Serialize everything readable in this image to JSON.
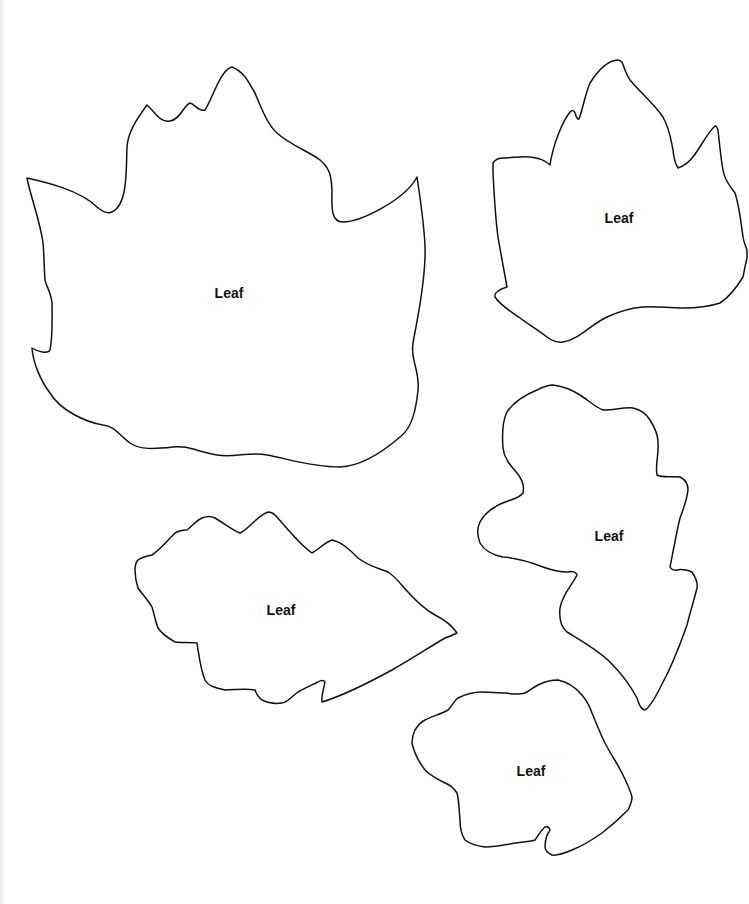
{
  "page": {
    "title": "",
    "background": "#ffffff",
    "stroke_color": "#111111"
  },
  "leaves": [
    {
      "id": "large-leaf",
      "label": "Leaf",
      "label_pos": [
        229,
        294
      ],
      "path": "M27,178 C45,182 80,190 97,207 C103,212 108,214 112,212 C128,205 126,170 127,147 C128,130 140,115 147,105 C155,112 160,123 170,121 C180,120 184,105 190,103 C195,104 198,112 205,110 C212,100 220,70 232,67 C245,72 250,85 255,93 C262,110 268,125 277,133 C290,145 310,152 320,160 C332,170 331,180 332,190 C332,205 330,222 343,222 C360,222 405,200 417,177 C422,210 426,240 425,257 C424,290 418,315 413,343 C410,360 420,370 418,390 C416,410 412,428 400,437 C385,450 362,466 340,467 C310,467 285,458 267,455 C250,451 235,458 217,455 C198,452 188,445 173,447 C155,449 140,450 130,443 C120,436 115,426 103,425 C85,422 60,410 50,393 C40,380 33,362 32,348 C38,352 48,354 50,350 C53,335 52,318 52,303 C51,292 46,286 45,280 C44,265 44,252 43,243 C40,220 30,195 27,178 Z"
    },
    {
      "id": "top-right-leaf",
      "label": "Leaf",
      "label_pos": [
        619,
        219
      ],
      "path": "M493,163 C495,160 499,158 503,158 C512,158 522,156 530,157 C540,158 546,161 550,165 C553,145 562,122 570,112 C572,110 574,110 575,113 C576,117 578,120 579,119 C583,108 585,95 590,83 C597,72 607,61 617,60 C620,60 621,61 622,62 C625,70 627,76 630,80 C640,92 655,105 663,117 C670,130 671,140 673,150 C674,160 676,165 678,168 C684,166 689,162 693,157 C700,148 708,132 715,126 C716,126 717,127 718,130 C720,148 721,160 723,170 C725,182 731,187 735,193 C739,205 741,222 743,237 C744,243 746,247 747,250 L747,258 C745,266 744,272 743,277 C735,290 728,298 720,303 C708,307 695,308 683,308 C668,308 655,306 643,307 C628,308 618,312 607,317 C590,325 578,340 563,342 C556,343 551,340 547,337 C538,330 528,324 520,318 C510,311 500,305 495,297 C494,292 500,289 507,287 C504,270 501,255 498,237 C495,215 494,190 493,173 Z"
    },
    {
      "id": "middle-right-leaf",
      "label": "Leaf",
      "label_pos": [
        609,
        537
      ],
      "path": "M507,412 C515,400 527,394 537,390 C543,387 548,385 553,385 C562,386 572,390 580,395 C588,400 595,407 603,410 C612,411 622,407 633,408 C642,410 647,415 650,420 C655,428 658,435 658,442 C659,455 655,465 657,475 C662,478 672,476 680,477 C686,480 688,485 688,490 C687,500 683,510 680,518 C676,535 673,552 670,567 C671,569 674,571 677,570 C682,569 687,570 692,572 C696,578 698,583 697,588 C694,600 690,613 687,625 C680,645 670,670 660,688 C655,698 650,707 645,710 C641,710 639,705 637,698 C630,685 620,672 610,662 C598,650 580,640 567,632 C561,627 559,618 560,608 C562,595 572,585 577,575 C576,572 572,571 568,572 C560,572 551,570 543,567 C530,562 515,558 503,557 C492,555 484,550 480,543 C477,535 477,528 480,522 C484,514 490,510 495,507 C505,500 518,500 523,493 C525,485 521,478 517,473 C510,465 504,458 503,448 C502,435 503,420 507,412 Z"
    },
    {
      "id": "bottom-left-leaf",
      "label": "Leaf",
      "label_pos": [
        281,
        611
      ],
      "path": "M138,560 C142,557 147,556 152,555 C160,550 168,540 175,533 C180,530 184,530 187,530 C193,525 197,520 202,518 C207,516 211,516 215,518 C224,523 232,530 240,533 C250,528 258,515 268,512 C271,512 273,513 275,515 C287,528 300,545 312,553 C318,550 325,542 332,540 C342,542 350,550 358,558 C368,566 378,568 388,572 C397,578 402,586 408,592 C417,602 426,610 435,615 C445,620 453,627 457,633 C453,635 448,637 445,638 C428,648 410,660 392,670 C370,682 345,695 322,702 C321,695 324,688 325,682 C324,680 321,680 318,682 C312,685 305,688 298,692 C292,696 287,703 282,703 C275,704 268,703 262,700 C258,697 256,693 255,690 C245,688 235,690 225,690 C216,688 208,686 205,680 C200,668 199,655 197,643 C190,642 182,643 175,642 C168,638 162,634 158,628 C155,620 154,613 152,607 C148,600 142,594 138,588 C136,582 135,576 135,570 C135,565 136,562 138,560 Z"
    },
    {
      "id": "bottom-right-leaf",
      "label": "Leaf",
      "label_pos": [
        531,
        772
      ],
      "path": "M415,730 C418,725 421,722 425,720 C433,716 441,714 448,710 C452,706 454,701 458,698 C466,694 474,692 482,692 C490,692 498,693 505,693 C512,694 519,695 525,693 C530,690 534,687 538,685 C544,682 551,680 558,680 C568,682 576,688 582,695 C587,701 590,707 592,713 C596,723 600,733 605,743 C610,753 617,763 622,773 C626,781 630,789 632,797 C632,802 630,806 628,810 C620,818 611,826 602,833 C592,840 582,846 572,850 C565,853 558,856 552,855 C548,853 545,850 545,847 C545,843 546,838 547,835 C548,833 550,831 550,830 C549,827 547,826 545,827 C541,830 538,836 535,840 C528,842 522,842 515,843 C505,845 495,847 485,847 C477,846 470,844 465,840 C461,834 460,827 460,820 C459,810 459,800 457,793 C454,788 450,785 445,783 C437,779 430,775 425,770 C419,762 414,753 412,743 C412,738 413,734 415,730 Z"
    }
  ]
}
